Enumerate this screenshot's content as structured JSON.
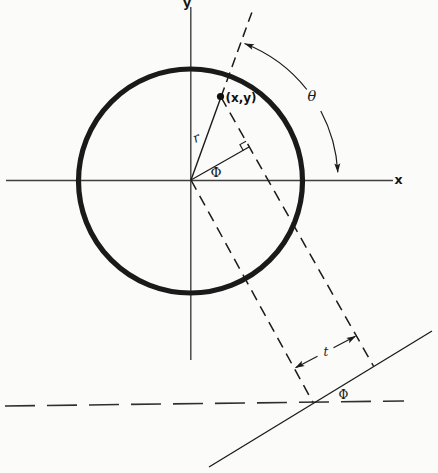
{
  "figure": {
    "type": "geometry-diagram",
    "labels": {
      "y_axis": "y",
      "x_axis": "x",
      "point": "(x,y)",
      "radius": "r",
      "angle_phi": "Φ",
      "angle_theta": "θ",
      "offset_t": "t",
      "angle_phi_bottom": "Φ"
    },
    "colors": {
      "background": "#fbfbf9",
      "ink": "#1a1a1a",
      "axis": "#3f3f3f"
    }
  }
}
